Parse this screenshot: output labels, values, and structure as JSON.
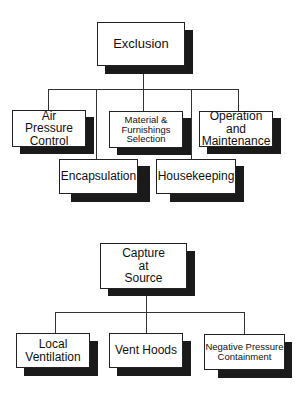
{
  "diagram": {
    "type": "hierarchy",
    "trees": [
      {
        "root": "Exclusion",
        "children": [
          "Air Pressure Control",
          "Material & Furnishings Selection",
          "Operation and Maintenance",
          "Encapsulation",
          "Housekeeping"
        ]
      },
      {
        "root": "Capture at Source",
        "children": [
          "Local Ventilation",
          "Vent Hoods",
          "Negative Pressure Containment"
        ]
      }
    ]
  },
  "nodes": {
    "exclusion": "Exclusion",
    "air_pressure": "Air\nPressure\nControl",
    "material": "Material &\nFurnishings\nSelection",
    "operation": "Operation and\nMaintenance",
    "encapsulation": "Encapsulation",
    "housekeeping": "Housekeeping",
    "capture": "Capture\nat\nSource",
    "local_vent": "Local\nVentilation",
    "vent_hoods": "Vent Hoods",
    "negative_pressure": "Negative Pressure\nContainment"
  }
}
